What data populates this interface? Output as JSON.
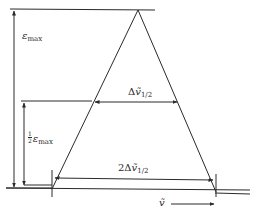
{
  "diagram": {
    "type": "triangular absorption band (half-width construction)",
    "colors": {
      "stroke": "#2a2a2a",
      "background": "#ffffff"
    },
    "labels": {
      "epsilon_max": {
        "symbol": "ε",
        "sub": "max"
      },
      "half_epsilon_max": {
        "num": "1",
        "den": "2",
        "symbol": "ε",
        "sub": "max"
      },
      "half_width": {
        "prefix": "Δ",
        "symbol": "ṽ",
        "sub": "1/2"
      },
      "full_base_width": {
        "prefix": "2Δ",
        "symbol": "ṽ",
        "sub": "1/2"
      },
      "x_axis": {
        "symbol": "ṽ"
      }
    },
    "geometry": {
      "apex": [
        138,
        10
      ],
      "base_left": [
        52,
        188
      ],
      "base_right": [
        216,
        190
      ],
      "top_line_y": 9,
      "half_height_y": 101,
      "base_width_line_y": 179,
      "baseline_y": [
        188,
        192
      ]
    }
  }
}
